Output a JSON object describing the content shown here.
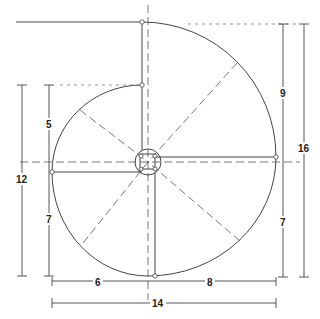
{
  "diagram": {
    "type": "spiral staircase plan",
    "colors": {
      "line": "#444444",
      "background": "#ffffff"
    },
    "dimensions": {
      "left_upper": "5",
      "left_lower": "7",
      "left_total": "12",
      "right_upper": "9",
      "right_lower": "7",
      "right_total": "16",
      "bottom_left": "6",
      "bottom_right": "8",
      "bottom_total": "14"
    }
  }
}
